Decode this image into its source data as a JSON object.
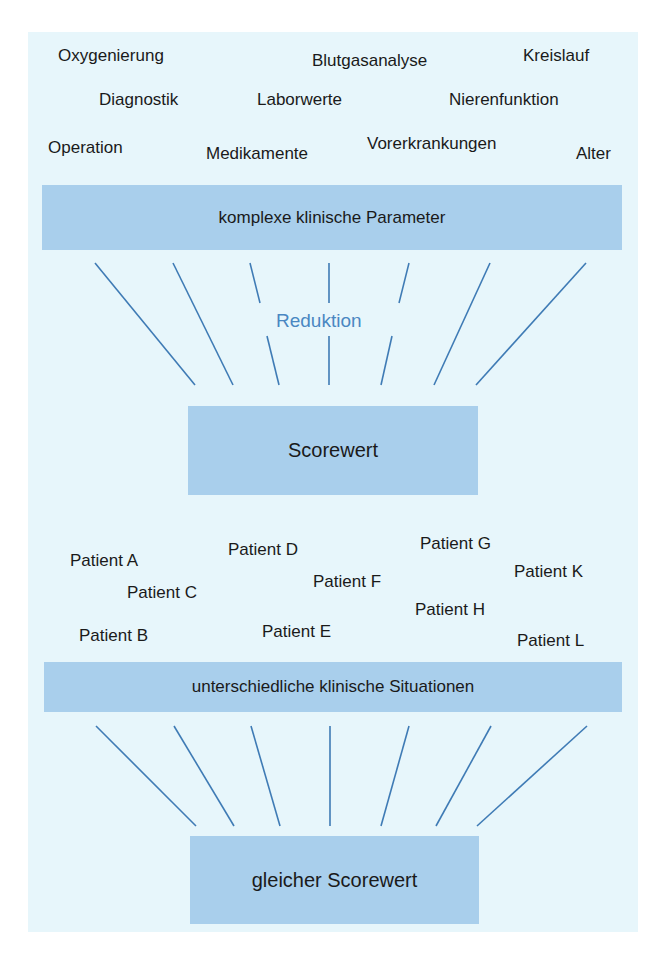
{
  "colors": {
    "panel_background": "#e7f6fb",
    "box_fill": "#a9cfec",
    "line_stroke": "#3f7bb5",
    "reduction_label": "#4a87c2",
    "text": "#1a1a1a"
  },
  "parameters": [
    {
      "label": "Oxygenierung",
      "x": 58,
      "y": 55
    },
    {
      "label": "Blutgasanalyse",
      "x": 312,
      "y": 60
    },
    {
      "label": "Kreislauf",
      "x": 523,
      "y": 55
    },
    {
      "label": "Diagnostik",
      "x": 99,
      "y": 99
    },
    {
      "label": "Laborwerte",
      "x": 257,
      "y": 99
    },
    {
      "label": "Nierenfunktion",
      "x": 449,
      "y": 99
    },
    {
      "label": "Operation",
      "x": 48,
      "y": 147
    },
    {
      "label": "Medikamente",
      "x": 206,
      "y": 153
    },
    {
      "label": "Vorerkrankungen",
      "x": 367,
      "y": 143
    },
    {
      "label": "Alter",
      "x": 576,
      "y": 153
    }
  ],
  "top_bar": {
    "label": "komplexe klinische Parameter"
  },
  "reduction": {
    "label": "Reduktion"
  },
  "score_box": {
    "label": "Scorewert"
  },
  "patients": [
    {
      "label": "Patient A",
      "x": 70,
      "y": 560
    },
    {
      "label": "Patient D",
      "x": 228,
      "y": 549
    },
    {
      "label": "Patient G",
      "x": 420,
      "y": 543
    },
    {
      "label": "Patient C",
      "x": 127,
      "y": 592
    },
    {
      "label": "Patient F",
      "x": 313,
      "y": 581
    },
    {
      "label": "Patient K",
      "x": 514,
      "y": 571
    },
    {
      "label": "Patient H",
      "x": 415,
      "y": 609
    },
    {
      "label": "Patient B",
      "x": 79,
      "y": 635
    },
    {
      "label": "Patient E",
      "x": 262,
      "y": 631
    },
    {
      "label": "Patient L",
      "x": 517,
      "y": 640
    }
  ],
  "bottom_bar": {
    "label": "unterschiedliche klinische Situationen"
  },
  "same_score_box": {
    "label": "gleicher Scorewert"
  }
}
